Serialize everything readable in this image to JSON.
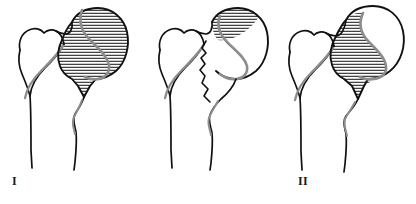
{
  "figure": {
    "background_color": "#ffffff",
    "width": 416,
    "height": 204,
    "outline_color": "#111111",
    "inner_contour_color": "#8d8d8d",
    "hatch_color": "#1a1a1a",
    "label_color": "#1a1a1a"
  },
  "panels": [
    {
      "id": "panel-1",
      "label": "I",
      "description": "Proximal femur with greater trochanter, neck and shaft; femoral head fully hatched with horizontal lines, traversed by a grey S-shaped contour",
      "head_hatch_extent": "full",
      "hatch_orientation": "horizontal",
      "hatch_spacing_px": 3
    },
    {
      "id": "panel-2",
      "label": "II",
      "description": "Proximal femur with greater trochanter, neck and shaft; only a small superolateral wedge of the femoral head is hatched, grey S-shaped contour present",
      "head_hatch_extent": "small superior wedge",
      "hatch_orientation": "horizontal",
      "hatch_spacing_px": 3
    },
    {
      "id": "panel-3",
      "label": "III",
      "description": "Proximal femur with greater trochanter, neck and shaft; medial portion of femoral head hatched up to the grey S-shaped contour",
      "head_hatch_extent": "medial half",
      "hatch_orientation": "horizontal",
      "hatch_spacing_px": 3
    }
  ]
}
